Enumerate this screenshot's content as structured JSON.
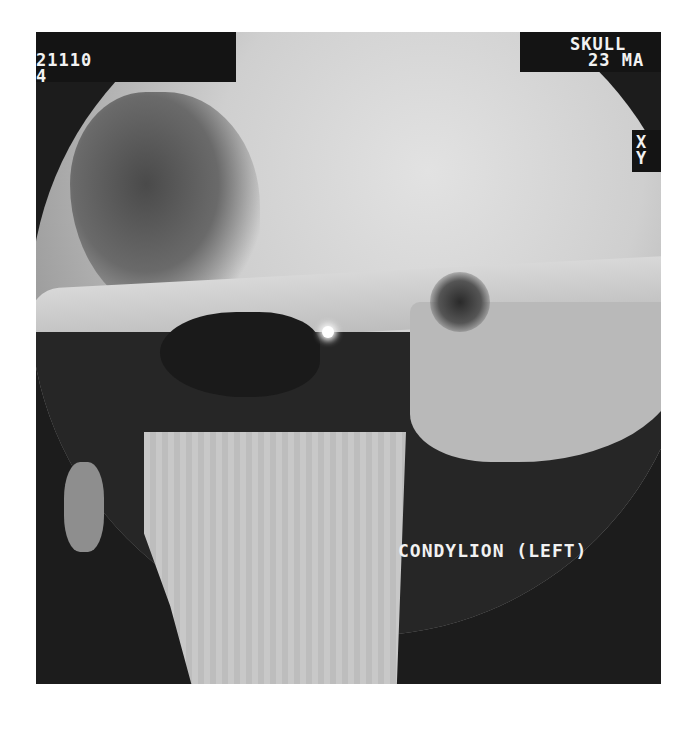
{
  "image": {
    "description": "Grayscale 3D CT surface rendering of skull, temporomandibular joint region with landmark marker",
    "overlay": {
      "top_left_id": "21110",
      "top_left_sub": "4",
      "top_right_title": "SKULL",
      "top_right_date": "23 MA",
      "axis_x": "X",
      "axis_y": "Y",
      "landmark_label": "CONDYLION (LEFT)"
    },
    "colors": {
      "background": "#1c1c1c",
      "bone": "#cfcfcf",
      "marker": "#ffffff",
      "text": "#f2f2f2"
    }
  }
}
